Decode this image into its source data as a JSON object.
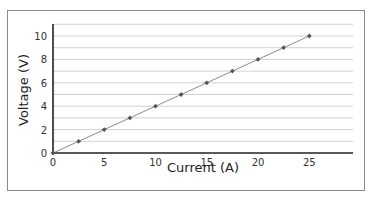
{
  "chart_data": {
    "type": "line",
    "title": "",
    "xlabel": "Current (A)",
    "ylabel": "Voltage (V)",
    "x": [
      0,
      2.5,
      5,
      7.5,
      10,
      12.5,
      15,
      17.5,
      20,
      22.5,
      25
    ],
    "series": [
      {
        "name": "Voltage",
        "values": [
          0,
          1,
          2,
          3,
          4,
          5,
          6,
          7,
          8,
          9,
          10
        ]
      }
    ],
    "xlim": [
      0,
      29
    ],
    "ylim": [
      0,
      11
    ],
    "xticks": [
      0,
      5,
      10,
      15,
      20,
      25
    ],
    "yticks": [
      0,
      2,
      4,
      6,
      8,
      10
    ],
    "grid": {
      "horizontal": true,
      "vertical": false,
      "step": 1
    },
    "legend": null,
    "colors": {
      "line": "#8c8c8c",
      "marker": "#555555",
      "grid": "#d0d0d0",
      "axis": "#222222",
      "frame": "#8a8a8a"
    }
  }
}
